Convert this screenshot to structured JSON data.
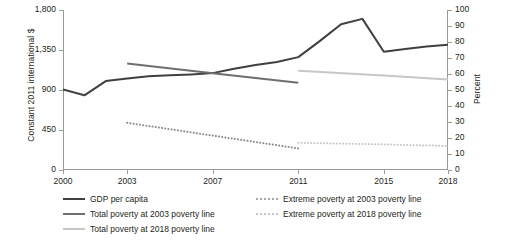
{
  "chart_data": {
    "type": "line",
    "title": "",
    "xlabel": "",
    "x_ticks": [
      "2000",
      "2003",
      "2007",
      "2011",
      "2015",
      "2018"
    ],
    "x_tick_values": [
      2000,
      2003,
      2007,
      2011,
      2015,
      2018
    ],
    "xlim": [
      2000,
      2018
    ],
    "grid": false,
    "legend_position": "bottom",
    "axes": {
      "left": {
        "label": "Constant 2011 international $",
        "ticks": [
          "0",
          "450",
          "900",
          "1,350",
          "1,800"
        ],
        "tick_values": [
          0,
          450,
          900,
          1350,
          1800
        ],
        "lim": [
          0,
          1800
        ]
      },
      "right": {
        "label": "Percent",
        "ticks": [
          "0",
          "10",
          "20",
          "30",
          "40",
          "50",
          "60",
          "70",
          "80",
          "90",
          "100"
        ],
        "tick_values": [
          0,
          10,
          20,
          30,
          40,
          50,
          60,
          70,
          80,
          90,
          100
        ],
        "lim": [
          0,
          100
        ]
      }
    },
    "series": [
      {
        "name": "GDP per capita",
        "axis": "left",
        "style": "solid",
        "color": "#3f3f44",
        "width": 2.0,
        "x": [
          2000,
          2001,
          2002,
          2003,
          2004,
          2005,
          2006,
          2007,
          2008,
          2009,
          2010,
          2011,
          2012,
          2013,
          2014,
          2015,
          2016,
          2017,
          2018
        ],
        "values": [
          905,
          840,
          1000,
          1030,
          1055,
          1065,
          1075,
          1090,
          1140,
          1180,
          1215,
          1270,
          1450,
          1640,
          1700,
          1330,
          1360,
          1390,
          1410
        ]
      },
      {
        "name": "Total poverty at 2003 poverty line",
        "axis": "right",
        "style": "solid",
        "color": "#6d6e71",
        "width": 2.0,
        "x": [
          2003,
          2007,
          2011
        ],
        "values": [
          66.5,
          60.5,
          54.5
        ]
      },
      {
        "name": "Total poverty at 2018 poverty line",
        "axis": "right",
        "style": "solid",
        "color": "#c6c7c9",
        "width": 2.0,
        "x": [
          2011,
          2015,
          2018
        ],
        "values": [
          62.0,
          59.0,
          56.5
        ]
      },
      {
        "name": "Extreme poverty at 2003 poverty line",
        "axis": "right",
        "style": "dotted",
        "color": "#8b8c8e",
        "width": 2.0,
        "x": [
          2003,
          2007,
          2011
        ],
        "values": [
          29.5,
          21.5,
          13.5
        ]
      },
      {
        "name": "Extreme poverty at 2018 poverty line",
        "axis": "right",
        "style": "dotted",
        "color": "#c6c7c9",
        "width": 2.0,
        "x": [
          2011,
          2015,
          2018
        ],
        "values": [
          17.0,
          16.0,
          15.0
        ]
      }
    ]
  },
  "legend": {
    "columns": [
      {
        "items": [
          {
            "label": "GDP per capita",
            "color": "#3f3f44",
            "style": "solid"
          },
          {
            "label": "Total poverty at 2003 poverty line",
            "color": "#6d6e71",
            "style": "solid"
          },
          {
            "label": "Total poverty at 2018 poverty line",
            "color": "#c6c7c9",
            "style": "solid"
          }
        ]
      },
      {
        "items": [
          {
            "label": "Extreme poverty at 2003 poverty line",
            "color": "#a8a9ab",
            "style": "dotted"
          },
          {
            "label": "Extreme poverty at 2018 poverty line",
            "color": "#c6c7c9",
            "style": "dotted"
          }
        ]
      }
    ]
  }
}
